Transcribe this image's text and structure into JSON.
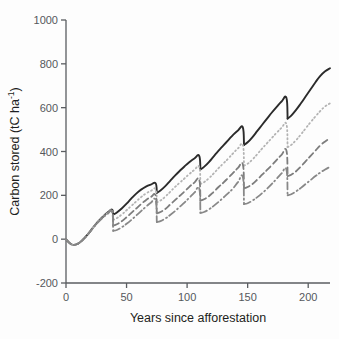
{
  "chart_data": {
    "type": "line",
    "title": "",
    "subtitle": "",
    "xlabel": "Years since afforestation",
    "ylabel_text": "Carbon stored (tC ha",
    "ylabel_exponent": "-1",
    "ylabel_tail": ")",
    "ylabel_full": "Carbon stored (tC ha-1)",
    "grid": false,
    "legend": "none",
    "xlim": [
      0,
      218
    ],
    "ylim": [
      -200,
      1000
    ],
    "xticks": [
      0,
      50,
      100,
      150,
      200
    ],
    "xtick_labels": [
      "0",
      "50",
      "100",
      "150",
      "200"
    ],
    "yticks": [
      -200,
      0,
      200,
      400,
      600,
      800,
      1000
    ],
    "ytick_labels": [
      "-200",
      "0",
      "200",
      "400",
      "600",
      "800",
      "1000"
    ],
    "rotation_period_years": 36,
    "harvest_years": [
      38,
      74,
      110,
      146,
      182
    ],
    "series": [
      {
        "name": "scenario-1-solid",
        "style": "solid",
        "color": "#2b2b2b",
        "width": 1.9,
        "end_value": 780,
        "peak_values": [
          135,
          255,
          380,
          510,
          645,
          780
        ],
        "trough_values": [
          112,
          212,
          318,
          430,
          550
        ],
        "points": [
          [
            0,
            0
          ],
          [
            3,
            -18
          ],
          [
            6,
            -26
          ],
          [
            10,
            -20
          ],
          [
            14,
            -2
          ],
          [
            18,
            22
          ],
          [
            22,
            50
          ],
          [
            26,
            78
          ],
          [
            30,
            100
          ],
          [
            34,
            120
          ],
          [
            38,
            135
          ],
          [
            39,
            112
          ],
          [
            42,
            122
          ],
          [
            46,
            140
          ],
          [
            50,
            162
          ],
          [
            54,
            186
          ],
          [
            58,
            208
          ],
          [
            62,
            226
          ],
          [
            66,
            240
          ],
          [
            70,
            249
          ],
          [
            74,
            255
          ],
          [
            75,
            212
          ],
          [
            78,
            222
          ],
          [
            82,
            242
          ],
          [
            86,
            266
          ],
          [
            90,
            290
          ],
          [
            94,
            312
          ],
          [
            98,
            333
          ],
          [
            102,
            352
          ],
          [
            106,
            368
          ],
          [
            110,
            380
          ],
          [
            111,
            318
          ],
          [
            114,
            330
          ],
          [
            118,
            352
          ],
          [
            122,
            378
          ],
          [
            126,
            404
          ],
          [
            130,
            428
          ],
          [
            134,
            452
          ],
          [
            138,
            476
          ],
          [
            142,
            496
          ],
          [
            146,
            510
          ],
          [
            147,
            430
          ],
          [
            150,
            442
          ],
          [
            154,
            466
          ],
          [
            158,
            494
          ],
          [
            162,
            522
          ],
          [
            166,
            550
          ],
          [
            170,
            578
          ],
          [
            174,
            604
          ],
          [
            178,
            628
          ],
          [
            182,
            645
          ],
          [
            183,
            550
          ],
          [
            186,
            564
          ],
          [
            190,
            590
          ],
          [
            194,
            620
          ],
          [
            198,
            652
          ],
          [
            202,
            684
          ],
          [
            206,
            716
          ],
          [
            210,
            745
          ],
          [
            214,
            766
          ],
          [
            218,
            780
          ]
        ]
      },
      {
        "name": "scenario-2-dotted",
        "style": "dotted",
        "color": "#b3b3b3",
        "width": 1.8,
        "end_value": 620,
        "peak_values": [
          132,
          228,
          330,
          430,
          525,
          620
        ],
        "trough_values": [
          88,
          168,
          252,
          336,
          420
        ],
        "points": [
          [
            0,
            0
          ],
          [
            3,
            -18
          ],
          [
            6,
            -26
          ],
          [
            10,
            -20
          ],
          [
            14,
            -2
          ],
          [
            18,
            22
          ],
          [
            22,
            50
          ],
          [
            26,
            78
          ],
          [
            30,
            100
          ],
          [
            34,
            118
          ],
          [
            38,
            132
          ],
          [
            39,
            88
          ],
          [
            42,
            96
          ],
          [
            46,
            112
          ],
          [
            50,
            132
          ],
          [
            54,
            152
          ],
          [
            58,
            172
          ],
          [
            62,
            192
          ],
          [
            66,
            208
          ],
          [
            70,
            220
          ],
          [
            74,
            228
          ],
          [
            75,
            168
          ],
          [
            78,
            176
          ],
          [
            82,
            194
          ],
          [
            86,
            216
          ],
          [
            90,
            238
          ],
          [
            94,
            258
          ],
          [
            98,
            278
          ],
          [
            102,
            298
          ],
          [
            106,
            316
          ],
          [
            110,
            330
          ],
          [
            111,
            252
          ],
          [
            114,
            260
          ],
          [
            118,
            278
          ],
          [
            122,
            300
          ],
          [
            126,
            324
          ],
          [
            130,
            346
          ],
          [
            134,
            368
          ],
          [
            138,
            392
          ],
          [
            142,
            414
          ],
          [
            146,
            430
          ],
          [
            147,
            336
          ],
          [
            150,
            344
          ],
          [
            154,
            364
          ],
          [
            158,
            388
          ],
          [
            162,
            414
          ],
          [
            166,
            438
          ],
          [
            170,
            462
          ],
          [
            174,
            486
          ],
          [
            178,
            508
          ],
          [
            182,
            525
          ],
          [
            183,
            420
          ],
          [
            186,
            430
          ],
          [
            190,
            452
          ],
          [
            194,
            478
          ],
          [
            198,
            506
          ],
          [
            202,
            534
          ],
          [
            206,
            560
          ],
          [
            210,
            585
          ],
          [
            214,
            606
          ],
          [
            218,
            620
          ]
        ]
      },
      {
        "name": "scenario-3-dashed",
        "style": "dashed",
        "color": "#7d7d7d",
        "width": 1.8,
        "end_value": 460,
        "peak_values": [
          128,
          200,
          272,
          342,
          405,
          460
        ],
        "trough_values": [
          62,
          118,
          176,
          232,
          288
        ],
        "points": [
          [
            0,
            0
          ],
          [
            3,
            -18
          ],
          [
            6,
            -26
          ],
          [
            10,
            -20
          ],
          [
            14,
            -2
          ],
          [
            18,
            22
          ],
          [
            22,
            50
          ],
          [
            26,
            76
          ],
          [
            30,
            98
          ],
          [
            34,
            116
          ],
          [
            38,
            128
          ],
          [
            39,
            62
          ],
          [
            42,
            68
          ],
          [
            46,
            82
          ],
          [
            50,
            100
          ],
          [
            54,
            120
          ],
          [
            58,
            140
          ],
          [
            62,
            160
          ],
          [
            66,
            178
          ],
          [
            70,
            192
          ],
          [
            74,
            200
          ],
          [
            75,
            118
          ],
          [
            78,
            124
          ],
          [
            82,
            138
          ],
          [
            86,
            158
          ],
          [
            90,
            178
          ],
          [
            94,
            198
          ],
          [
            98,
            218
          ],
          [
            102,
            240
          ],
          [
            106,
            258
          ],
          [
            110,
            272
          ],
          [
            111,
            176
          ],
          [
            114,
            182
          ],
          [
            118,
            196
          ],
          [
            122,
            216
          ],
          [
            126,
            238
          ],
          [
            130,
            258
          ],
          [
            134,
            280
          ],
          [
            138,
            302
          ],
          [
            142,
            325
          ],
          [
            146,
            342
          ],
          [
            147,
            232
          ],
          [
            150,
            238
          ],
          [
            154,
            252
          ],
          [
            158,
            272
          ],
          [
            162,
            294
          ],
          [
            166,
            316
          ],
          [
            170,
            338
          ],
          [
            174,
            362
          ],
          [
            178,
            385
          ],
          [
            182,
            405
          ],
          [
            183,
            288
          ],
          [
            186,
            294
          ],
          [
            190,
            310
          ],
          [
            194,
            332
          ],
          [
            198,
            356
          ],
          [
            202,
            380
          ],
          [
            206,
            404
          ],
          [
            210,
            428
          ],
          [
            214,
            446
          ],
          [
            218,
            460
          ]
        ]
      },
      {
        "name": "scenario-4-dashdot",
        "style": "dashdot",
        "color": "#888888",
        "width": 1.8,
        "end_value": 330,
        "peak_values": [
          124,
          178,
          232,
          285,
          318,
          330
        ],
        "trough_values": [
          38,
          78,
          120,
          160,
          200
        ],
        "points": [
          [
            0,
            0
          ],
          [
            3,
            -18
          ],
          [
            6,
            -26
          ],
          [
            10,
            -20
          ],
          [
            14,
            -2
          ],
          [
            18,
            22
          ],
          [
            22,
            48
          ],
          [
            26,
            74
          ],
          [
            30,
            96
          ],
          [
            34,
            114
          ],
          [
            38,
            124
          ],
          [
            39,
            38
          ],
          [
            42,
            42
          ],
          [
            46,
            54
          ],
          [
            50,
            70
          ],
          [
            54,
            88
          ],
          [
            58,
            108
          ],
          [
            62,
            128
          ],
          [
            66,
            148
          ],
          [
            70,
            166
          ],
          [
            74,
            178
          ],
          [
            75,
            78
          ],
          [
            78,
            82
          ],
          [
            82,
            94
          ],
          [
            86,
            110
          ],
          [
            90,
            128
          ],
          [
            94,
            148
          ],
          [
            98,
            168
          ],
          [
            102,
            190
          ],
          [
            106,
            212
          ],
          [
            110,
            232
          ],
          [
            111,
            120
          ],
          [
            114,
            124
          ],
          [
            118,
            136
          ],
          [
            122,
            152
          ],
          [
            126,
            170
          ],
          [
            130,
            190
          ],
          [
            134,
            210
          ],
          [
            138,
            232
          ],
          [
            142,
            260
          ],
          [
            146,
            285
          ],
          [
            147,
            160
          ],
          [
            150,
            164
          ],
          [
            154,
            176
          ],
          [
            158,
            192
          ],
          [
            162,
            210
          ],
          [
            166,
            230
          ],
          [
            170,
            252
          ],
          [
            174,
            276
          ],
          [
            178,
            300
          ],
          [
            182,
            318
          ],
          [
            183,
            200
          ],
          [
            186,
            205
          ],
          [
            190,
            218
          ],
          [
            194,
            234
          ],
          [
            198,
            252
          ],
          [
            202,
            270
          ],
          [
            206,
            288
          ],
          [
            210,
            304
          ],
          [
            214,
            318
          ],
          [
            218,
            330
          ]
        ]
      }
    ]
  },
  "axes": {
    "x_title": "Years since afforestation",
    "y_title": "Carbon stored (tC ha-1)",
    "axis_color": "#5a5d61"
  }
}
